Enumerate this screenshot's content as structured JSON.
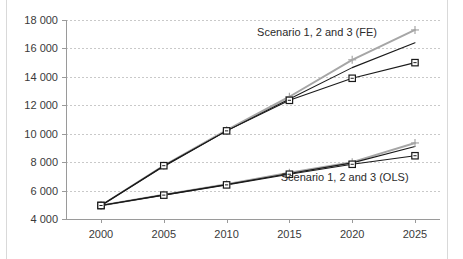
{
  "chart_data": {
    "type": "line",
    "title": "",
    "subtitle": "",
    "xlabel": "",
    "ylabel": "",
    "x": [
      2000,
      2005,
      2010,
      2015,
      2020,
      2025
    ],
    "categories": [
      "2000",
      "2005",
      "2010",
      "2015",
      "2020",
      "2025"
    ],
    "xlim": [
      1998,
      2026
    ],
    "ylim": [
      4000,
      18000
    ],
    "ytick_values": [
      4000,
      6000,
      8000,
      10000,
      12000,
      14000,
      16000,
      18000
    ],
    "ytick_labels": [
      "4 000",
      "6 000",
      "8 000",
      "10 000",
      "12 000",
      "14 000",
      "16 000",
      "18 000"
    ],
    "xtick_labels": [
      "2000",
      "2005",
      "2010",
      "2015",
      "2020",
      "2025"
    ],
    "grid": "horizontal-dashed",
    "legend_position": "inline-annotation",
    "annotations": [
      {
        "text": "Scenario 1, 2 and 3 (FE)",
        "x": 2017.2,
        "y": 16850,
        "group": "FE"
      },
      {
        "text": "Scenario 1, 2 and 3 (OLS)",
        "x": 2019.4,
        "y": 6700,
        "group": "OLS"
      }
    ],
    "series": [
      {
        "name": "Scenario 1 (FE)",
        "group": "FE",
        "color": "#a6a6a6",
        "marker": "plus",
        "values": [
          4950,
          7750,
          10250,
          12600,
          15200,
          17300
        ]
      },
      {
        "name": "Scenario 2 (FE)",
        "group": "FE",
        "color": "#1a1a1a",
        "marker": "none",
        "values": [
          4950,
          7700,
          10200,
          12450,
          14650,
          16400
        ]
      },
      {
        "name": "Scenario 3 (FE)",
        "group": "FE",
        "color": "#1a1a1a",
        "marker": "square",
        "values": [
          4950,
          7750,
          10200,
          12350,
          13900,
          15000
        ]
      },
      {
        "name": "Scenario 1 (OLS)",
        "group": "OLS",
        "color": "#a6a6a6",
        "marker": "plus",
        "values": [
          4950,
          5700,
          6450,
          7250,
          8000,
          9350
        ]
      },
      {
        "name": "Scenario 2 (OLS)",
        "group": "OLS",
        "color": "#1a1a1a",
        "marker": "none",
        "values": [
          4950,
          5700,
          6430,
          7200,
          7950,
          9100
        ]
      },
      {
        "name": "Scenario 3 (OLS)",
        "group": "OLS",
        "color": "#1a1a1a",
        "marker": "square",
        "values": [
          4950,
          5680,
          6400,
          7150,
          7850,
          8450
        ]
      }
    ]
  },
  "colors": {
    "gray_series": "#a6a6a6",
    "black_series": "#1a1a1a",
    "gridline": "#c9c9c9",
    "axis": "#9a9a9a",
    "text": "#3a3a3a",
    "background": "#ffffff",
    "frame": "#d9d9d9"
  }
}
